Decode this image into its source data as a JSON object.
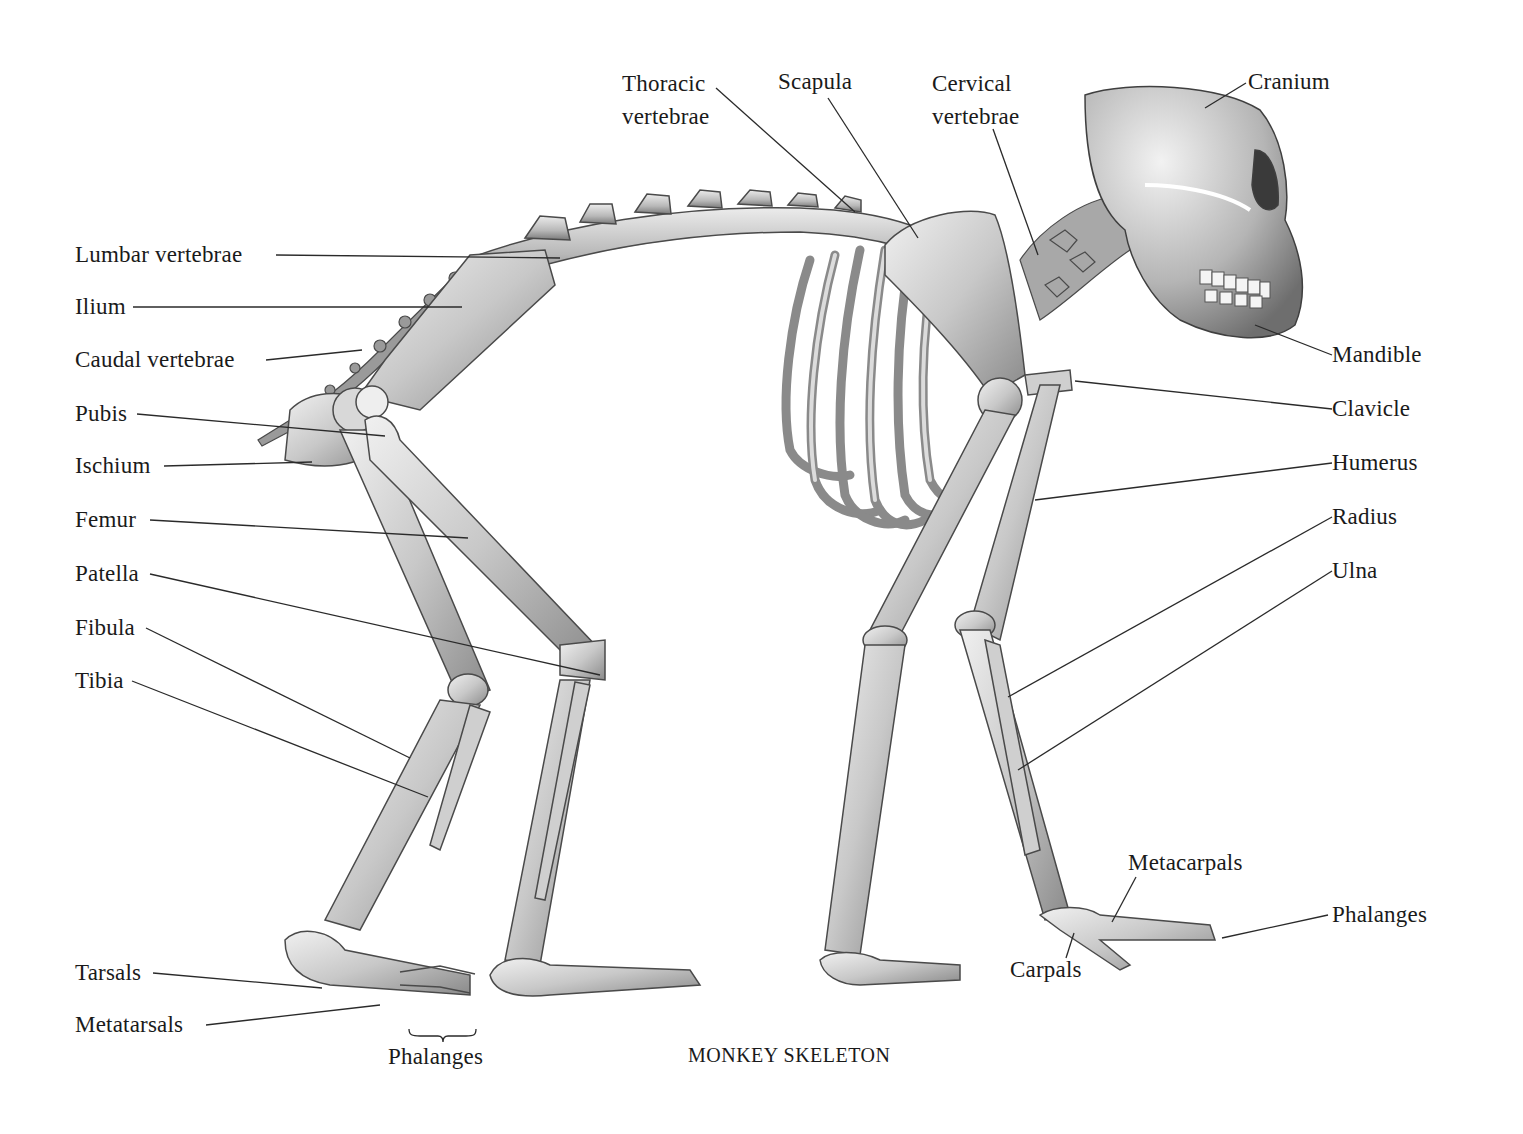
{
  "diagram": {
    "title": "MONKEY SKELETON",
    "colors": {
      "background": "#ffffff",
      "bone_light": "#e6e6e6",
      "bone_mid": "#bdbdbd",
      "bone_dark": "#7d7d7d",
      "outline": "#4a4a4a",
      "leader_line": "#2a2a2a",
      "text": "#1a1a1a"
    },
    "labels": {
      "thoracic_vertebrae": {
        "line1": "Thoracic",
        "line2": "vertebrae"
      },
      "scapula": "Scapula",
      "cervical_vertebrae": {
        "line1": "Cervical",
        "line2": "vertebrae"
      },
      "cranium": "Cranium",
      "lumbar_vertebrae": "Lumbar vertebrae",
      "ilium": "Ilium",
      "caudal_vertebrae": "Caudal vertebrae",
      "pubis": "Pubis",
      "ischium": "Ischium",
      "femur": "Femur",
      "patella": "Patella",
      "fibula": "Fibula",
      "tibia": "Tibia",
      "tarsals": "Tarsals",
      "metatarsals": "Metatarsals",
      "foot_phalanges": "Phalanges",
      "mandible": "Mandible",
      "clavicle": "Clavicle",
      "humerus": "Humerus",
      "radius": "Radius",
      "ulna": "Ulna",
      "metacarpals": "Metacarpals",
      "hand_phalanges": "Phalanges",
      "carpals": "Carpals"
    }
  }
}
